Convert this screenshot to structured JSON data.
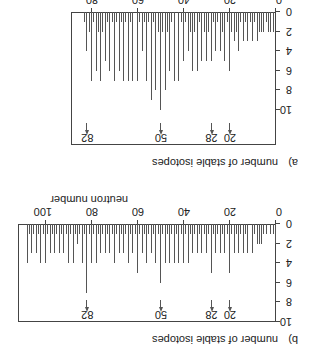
{
  "figure": {
    "rotation_deg": 180,
    "panels": [
      {
        "id": "a",
        "label": "a)",
        "ylabel": "number of stable isotopes",
        "xlabel": "proton number",
        "xticks": [
          "0",
          "20",
          "40",
          "60",
          "80"
        ],
        "yticks": [
          "0",
          "2",
          "4",
          "6",
          "8",
          "10"
        ],
        "magic_numbers": [
          "20",
          "28",
          "50",
          "82"
        ]
      },
      {
        "id": "b",
        "label": "b)",
        "ylabel": "number of stable isotopes",
        "xlabel": "neutron number",
        "xticks": [
          "0",
          "20",
          "40",
          "60",
          "80",
          "100"
        ],
        "yticks": [
          "0",
          "2",
          "4",
          "6",
          "8",
          "10"
        ],
        "magic_numbers": [
          "20",
          "28",
          "50",
          "82"
        ]
      }
    ]
  },
  "chart_data": [
    {
      "type": "bar",
      "title": "a)",
      "xlabel": "proton number",
      "ylabel": "number of stable isotopes",
      "xlim": [
        0,
        88
      ],
      "ylim": [
        0,
        10
      ],
      "annotations": [
        "20",
        "28",
        "50",
        "82"
      ],
      "x": [
        1,
        2,
        3,
        4,
        5,
        6,
        7,
        8,
        9,
        10,
        11,
        12,
        13,
        14,
        15,
        16,
        17,
        18,
        19,
        20,
        21,
        22,
        23,
        24,
        25,
        26,
        27,
        28,
        29,
        30,
        31,
        32,
        33,
        34,
        35,
        36,
        37,
        38,
        39,
        40,
        41,
        42,
        43,
        44,
        45,
        46,
        47,
        48,
        49,
        50,
        51,
        52,
        53,
        54,
        55,
        56,
        57,
        58,
        59,
        60,
        61,
        62,
        63,
        64,
        65,
        66,
        67,
        68,
        69,
        70,
        71,
        72,
        73,
        74,
        75,
        76,
        77,
        78,
        79,
        80,
        81,
        82,
        83
      ],
      "values": [
        2,
        2,
        2,
        1,
        2,
        2,
        2,
        3,
        1,
        3,
        1,
        3,
        1,
        3,
        1,
        4,
        2,
        3,
        2,
        6,
        1,
        5,
        2,
        4,
        1,
        4,
        1,
        5,
        2,
        5,
        2,
        5,
        1,
        6,
        2,
        6,
        2,
        4,
        1,
        5,
        1,
        7,
        0,
        7,
        1,
        6,
        2,
        8,
        2,
        10,
        2,
        8,
        1,
        9,
        1,
        7,
        1,
        4,
        1,
        7,
        0,
        7,
        1,
        7,
        1,
        7,
        1,
        6,
        1,
        7,
        1,
        6,
        1,
        5,
        2,
        7,
        2,
        6,
        1,
        7,
        2,
        4,
        1
      ]
    },
    {
      "type": "bar",
      "title": "b)",
      "xlabel": "neutron number",
      "ylabel": "number of stable isotopes",
      "xlim": [
        0,
        108
      ],
      "ylim": [
        0,
        10
      ],
      "annotations": [
        "20",
        "28",
        "50",
        "82"
      ],
      "x": [
        0,
        1,
        2,
        3,
        4,
        5,
        6,
        7,
        8,
        9,
        10,
        11,
        12,
        13,
        14,
        15,
        16,
        17,
        18,
        19,
        20,
        21,
        22,
        23,
        24,
        25,
        26,
        27,
        28,
        29,
        30,
        31,
        32,
        33,
        34,
        35,
        36,
        37,
        38,
        39,
        40,
        41,
        42,
        43,
        44,
        45,
        46,
        47,
        48,
        49,
        50,
        51,
        52,
        53,
        54,
        55,
        56,
        57,
        58,
        59,
        60,
        61,
        62,
        63,
        64,
        65,
        66,
        67,
        68,
        69,
        70,
        71,
        72,
        73,
        74,
        75,
        76,
        77,
        78,
        79,
        80,
        81,
        82,
        83,
        84,
        85,
        86,
        87,
        88,
        89,
        90,
        91,
        92,
        93,
        94,
        95,
        96,
        97,
        98,
        99,
        100,
        101,
        102,
        103,
        104,
        105,
        106,
        107,
        108,
        109,
        110,
        111,
        112,
        113,
        114,
        115,
        116,
        117,
        118,
        119,
        120,
        121,
        122,
        123,
        124,
        125,
        126
      ],
      "values": [
        2,
        1,
        1,
        0,
        1,
        1,
        2,
        2,
        2,
        1,
        3,
        0,
        3,
        1,
        3,
        1,
        3,
        1,
        3,
        1,
        5,
        1,
        3,
        1,
        3,
        1,
        3,
        1,
        5,
        1,
        3,
        1,
        3,
        1,
        3,
        1,
        3,
        1,
        4,
        1,
        4,
        1,
        4,
        1,
        4,
        1,
        4,
        1,
        4,
        1,
        6,
        1,
        4,
        1,
        3,
        1,
        4,
        1,
        3,
        1,
        5,
        1,
        3,
        1,
        4,
        1,
        3,
        1,
        3,
        1,
        4,
        1,
        3,
        1,
        3,
        1,
        3,
        1,
        4,
        1,
        4,
        1,
        7,
        1,
        4,
        1,
        2,
        1,
        4,
        1,
        4,
        1,
        3,
        1,
        3,
        1,
        3,
        1,
        3,
        1,
        4,
        1,
        4,
        1,
        3,
        1,
        3,
        1,
        4
      ]
    }
  ]
}
